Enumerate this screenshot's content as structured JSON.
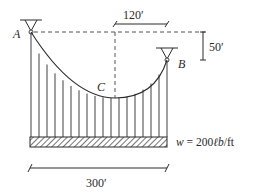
{
  "diagram": {
    "type": "suspension-cable-free-body",
    "labels": {
      "support_a": "A",
      "support_b": "B",
      "lowest_point": "C",
      "horizontal_offset": "120′",
      "sag_difference": "50′",
      "span": "300′",
      "load_prefix": "w = 200",
      "load_unit_italic": "ℓb",
      "load_suffix": "/ft"
    },
    "geometry": {
      "span_ft": 300,
      "offset_c_to_b_ft": 120,
      "height_difference_ft": 50,
      "distributed_load": "200 lb/ft"
    },
    "colors": {
      "line": "#2a2a2a",
      "dash": "#555555",
      "background": "#ffffff"
    }
  }
}
